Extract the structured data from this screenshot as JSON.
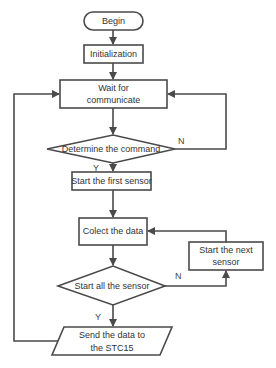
{
  "diagram": {
    "type": "flowchart",
    "colors": {
      "stroke": "#4a4a4a",
      "fill": "#ffffff",
      "text": "#333333"
    },
    "nodes": {
      "begin": {
        "shape": "terminal",
        "label": "Begin"
      },
      "init": {
        "shape": "process",
        "label": "Initialization"
      },
      "wait": {
        "shape": "process",
        "line1": "Wait for",
        "line2": "communicate"
      },
      "determine": {
        "shape": "decision",
        "label": "Determine the command"
      },
      "first_sensor": {
        "shape": "process",
        "label": "Start the first sensor"
      },
      "collect": {
        "shape": "process",
        "label": "Colect the data"
      },
      "next_sensor": {
        "shape": "process",
        "line1": "Start the next",
        "line2": "sensor"
      },
      "all_sensor": {
        "shape": "decision",
        "label": "Start all the sensor"
      },
      "send": {
        "shape": "io",
        "line1": "Send the data to",
        "line2": "the STC15"
      }
    },
    "edge_labels": {
      "determine_no": "N",
      "determine_yes": "Y",
      "all_no": "N",
      "all_yes": "Y"
    },
    "edges": [
      [
        "begin",
        "init"
      ],
      [
        "init",
        "wait"
      ],
      [
        "wait",
        "determine"
      ],
      [
        "determine",
        "wait",
        "N"
      ],
      [
        "determine",
        "first_sensor",
        "Y"
      ],
      [
        "first_sensor",
        "collect"
      ],
      [
        "collect",
        "all_sensor"
      ],
      [
        "all_sensor",
        "next_sensor",
        "N"
      ],
      [
        "next_sensor",
        "collect"
      ],
      [
        "all_sensor",
        "send",
        "Y"
      ],
      [
        "send",
        "wait"
      ]
    ]
  }
}
